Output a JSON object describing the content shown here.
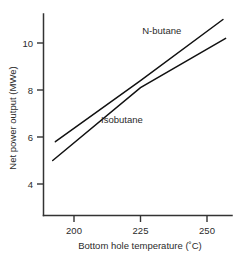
{
  "chart_data": {
    "type": "line",
    "title": "",
    "subtitle": "",
    "xlabel": "Bottom hole temperature (˚C)",
    "ylabel": "Net power output (MWe)",
    "xlim": [
      188,
      260
    ],
    "ylim": [
      2.6,
      11.6
    ],
    "xticks": [
      200,
      225,
      250
    ],
    "xtick_labels": [
      "200",
      "225",
      "250"
    ],
    "yticks": [
      4,
      6,
      8,
      10
    ],
    "ytick_labels": [
      "4",
      "6",
      "8",
      "10"
    ],
    "grid": false,
    "legend_position": "inline-annotation",
    "series": [
      {
        "name": "N-butane",
        "label": "N-butane",
        "x": [
          193,
          225,
          256
        ],
        "values": [
          5.8,
          8.4,
          11.0
        ],
        "annotation_x": 233,
        "annotation_y": 10.4
      },
      {
        "name": "Isobutane",
        "label": "Isobutane",
        "x": [
          192,
          225,
          257
        ],
        "values": [
          5.0,
          8.1,
          10.2
        ],
        "annotation_x": 218,
        "annotation_y": 6.6
      }
    ]
  },
  "axes": {
    "x_title": "Bottom hole temperature (˚C)",
    "y_title": "Net power output (MWe)",
    "x_tick_200": "200",
    "x_tick_225": "225",
    "x_tick_250": "250",
    "y_tick_4": "4",
    "y_tick_6": "6",
    "y_tick_8": "8",
    "y_tick_10": "10"
  },
  "annotations": {
    "series_1_label": "N-butane",
    "series_2_label": "Isobutane"
  },
  "colors": {
    "background": "#ffffff",
    "axis": "#333333",
    "line": "#111111",
    "text": "#2b2b2b"
  }
}
